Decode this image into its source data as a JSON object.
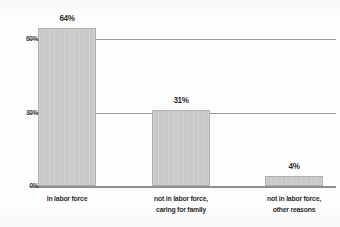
{
  "chart_data": {
    "type": "bar",
    "title": "",
    "subtitle": "",
    "xlabel": "",
    "ylabel": "",
    "categories": [
      "in labor force",
      "not in labor force, caring for family",
      "not in labor force, other reasons"
    ],
    "category_lines": [
      [
        "in labor force"
      ],
      [
        "not in labor force,",
        "caring for family"
      ],
      [
        "not in labor force,",
        "other reasons"
      ]
    ],
    "values": [
      64,
      31,
      4
    ],
    "data_labels": [
      "64%",
      "31%",
      "4%"
    ],
    "ylim": [
      0,
      64
    ],
    "yticks": [
      0,
      30,
      60
    ],
    "ytick_labels": [
      "0%",
      "30%",
      "60%"
    ],
    "grid": true,
    "gridlines_at": [
      30,
      60
    ],
    "legend": null,
    "annotations": [],
    "colors": {
      "bar_fill": "#c9c9c9",
      "bar_edge": "#b0b0b0",
      "grid": "#9a9a9a",
      "axis": "#8f8f8f",
      "text": "#2e2e2e",
      "background": "#fdfdfd"
    }
  },
  "axis": {
    "y": {
      "tick_0": "0%",
      "tick_30": "30%",
      "tick_60": "60%"
    }
  },
  "bars": [
    {
      "label": "in labor force",
      "value_label": "64%",
      "line1": "in labor force",
      "line2": ""
    },
    {
      "label": "not in labor force, caring for family",
      "value_label": "31%",
      "line1": "not in labor force,",
      "line2": "caring for family"
    },
    {
      "label": "not in labor force, other reasons",
      "value_label": "4%",
      "line1": "not in labor force,",
      "line2": "other reasons"
    }
  ]
}
